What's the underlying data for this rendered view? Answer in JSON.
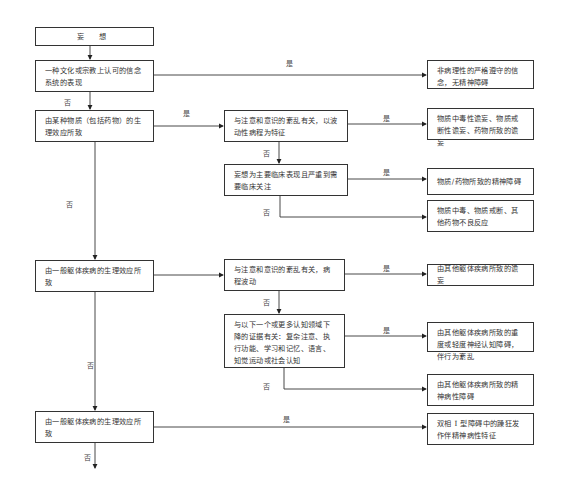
{
  "flowchart": {
    "edge_labels": {
      "yes": "是",
      "no": "否"
    },
    "main_column": [
      {
        "id": "start",
        "text": "妄 想"
      },
      {
        "id": "q_culture",
        "text": "一种文化或宗教上认可的信念系统的表现"
      },
      {
        "id": "q_substance",
        "text": "由某种物质（包括药物）的生理效应所致"
      },
      {
        "id": "q_medical",
        "text": "由一般躯体疾病的生理效应所致"
      },
      {
        "id": "q_medical_2",
        "text": "由一般躯体疾病的生理效应所致"
      }
    ],
    "middle_column": [
      {
        "id": "q_sub_delirium",
        "text": "与注意和意识的紊乱有关，以波动性病程为特征"
      },
      {
        "id": "q_sub_attention",
        "text": "妄想为主要临床表现且严重到需要临床关注"
      },
      {
        "id": "q_med_delirium",
        "text": "与注意和意识的紊乱有关，病程波动"
      },
      {
        "id": "q_med_cognitive",
        "text": "与以下一个或更多认知领域下降的证据有关：复杂注意、执行功能、学习和记忆、语言、知觉运动或社会认知"
      }
    ],
    "outcomes": [
      {
        "id": "o_nonpath",
        "text": "非病理性的严格遵守的信念，无精神障碍"
      },
      {
        "id": "o_sub_delirium",
        "text": "物质中毒性谵妄、物质戒断性谵妄、药物所致的谵妄"
      },
      {
        "id": "o_sub_psychotic",
        "text": "物质/药物所致的精神障碍"
      },
      {
        "id": "o_sub_other",
        "text": "物质中毒、物质戒断、其他药物不良反应"
      },
      {
        "id": "o_med_delirium",
        "text": "由其他躯体疾病所致的谵妄"
      },
      {
        "id": "o_med_ncd",
        "text": "由其他躯体疾病所致的重度或轻度神经认知障碍，伴行为紊乱"
      },
      {
        "id": "o_med_psychotic",
        "text": "由其他躯体疾病所致的精神病性障碍"
      },
      {
        "id": "o_bipolar",
        "text": "双相 Ⅰ 型障碍中的躁狂发作伴精神病性特征"
      }
    ]
  }
}
